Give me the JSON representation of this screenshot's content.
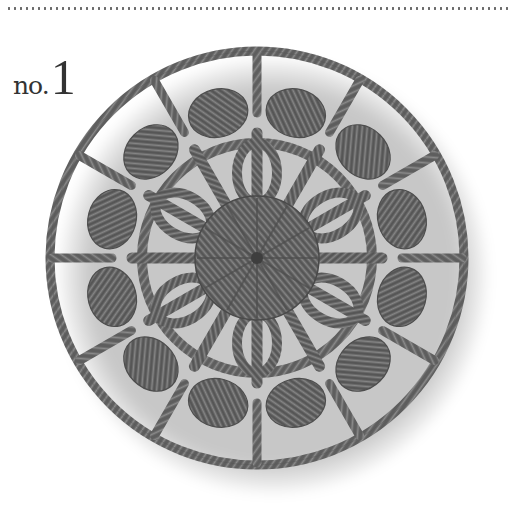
{
  "header": {
    "rule_style": "dotted"
  },
  "label": {
    "prefix": "no.",
    "number": "1"
  },
  "image": {
    "subject": "crochet-doily-round",
    "yarn_color": "#6e6e6e",
    "yarn_dark": "#4a4a4a",
    "background": "#ffffff"
  }
}
